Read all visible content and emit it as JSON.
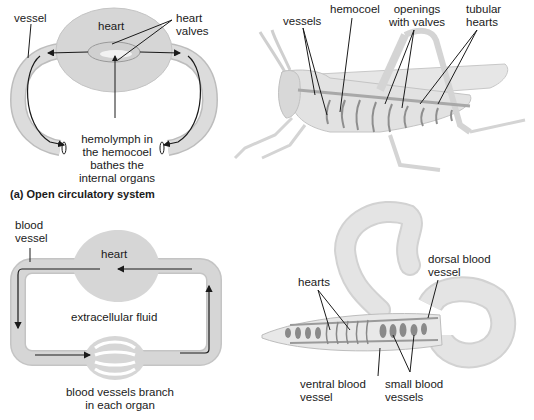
{
  "figure": {
    "panel_a": {
      "caption": "(a) Open circulatory system",
      "schematic": {
        "vessel": "vessel",
        "heart": "heart",
        "heart_valves": [
          "heart",
          "valves"
        ],
        "hemolymph": [
          "hemolymph in",
          "the hemocoel",
          "bathes the",
          "internal organs"
        ]
      },
      "grasshopper": {
        "vessels": "vessels",
        "hemocoel": "hemocoel",
        "openings": [
          "openings",
          "with valves"
        ],
        "tubular_hearts": [
          "tubular",
          "hearts"
        ]
      }
    },
    "panel_b": {
      "schematic": {
        "blood_vessel": [
          "blood",
          "vessel"
        ],
        "heart": "heart",
        "extracellular_fluid": "extracellular fluid",
        "branch": [
          "blood vessels branch",
          "in each organ"
        ]
      },
      "earthworm": {
        "hearts": "hearts",
        "dorsal": [
          "dorsal blood",
          "vessel"
        ],
        "ventral": [
          "ventral blood",
          "vessel"
        ],
        "small": [
          "small blood",
          "vessels"
        ]
      }
    },
    "colors": {
      "fill_grey": "#d6d6d6",
      "fill_light": "#ececec",
      "stroke": "#9a9a9a",
      "arrow": "#1a1a1a"
    }
  }
}
